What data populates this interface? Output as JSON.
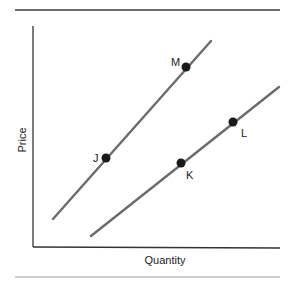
{
  "chart_data": {
    "type": "line",
    "title": "",
    "xlabel": "Quantity",
    "ylabel": "Price",
    "grid": false,
    "legend": null,
    "ticks": {
      "x": [],
      "y": []
    },
    "series": [
      {
        "name": "Curve 1 (upper-left)",
        "line_color": "#6b6b6b",
        "start": [
          53,
          219
        ],
        "end": [
          211,
          41
        ],
        "points": [
          {
            "label": "J",
            "x": 106,
            "y": 158,
            "label_dx": -13,
            "label_dy": 4
          },
          {
            "label": "M",
            "x": 186,
            "y": 67,
            "label_dx": -15,
            "label_dy": -1
          }
        ]
      },
      {
        "name": "Curve 2 (lower-right)",
        "line_color": "#6b6b6b",
        "start": [
          91,
          236
        ],
        "end": [
          279,
          87
        ],
        "points": [
          {
            "label": "K",
            "x": 181,
            "y": 163,
            "label_dx": 5,
            "label_dy": 16
          },
          {
            "label": "L",
            "x": 233,
            "y": 122,
            "label_dx": 8,
            "label_dy": 15
          }
        ]
      }
    ],
    "annotations": [
      "J",
      "M",
      "K",
      "L"
    ]
  },
  "colors": {
    "axis": "#333333",
    "line": "#6b6b6b",
    "point": "#1a1a1a",
    "rule": "#777777",
    "text": "#222222"
  }
}
